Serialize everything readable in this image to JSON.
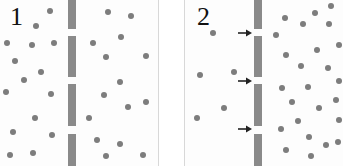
{
  "colors": {
    "background": "#fdfdfd",
    "membrane": "#8a8a8a",
    "particle": "#7d7d7d",
    "arrow": "#222222",
    "separator": "#d8d8d8"
  },
  "panels": [
    {
      "label": "1",
      "description": "membrane with pores, particles on both sides",
      "membrane_x": 68,
      "segments": [
        [
          0,
          29
        ],
        [
          36,
          77
        ],
        [
          84,
          126
        ],
        [
          134,
          166
        ]
      ],
      "particles_left": [
        [
          50,
          11
        ],
        [
          36,
          26
        ],
        [
          7,
          43
        ],
        [
          32,
          45
        ],
        [
          54,
          43
        ],
        [
          15,
          61
        ],
        [
          41,
          72
        ],
        [
          24,
          80
        ],
        [
          6,
          92
        ],
        [
          51,
          94
        ],
        [
          35,
          118
        ],
        [
          13,
          132
        ],
        [
          52,
          135
        ],
        [
          10,
          155
        ],
        [
          33,
          153
        ]
      ],
      "particles_right": [
        [
          108,
          12
        ],
        [
          131,
          16
        ],
        [
          93,
          43
        ],
        [
          121,
          37
        ],
        [
          106,
          57
        ],
        [
          146,
          56
        ],
        [
          120,
          82
        ],
        [
          104,
          95
        ],
        [
          146,
          102
        ],
        [
          128,
          107
        ],
        [
          89,
          118
        ],
        [
          97,
          140
        ],
        [
          120,
          144
        ],
        [
          106,
          156
        ],
        [
          143,
          155
        ]
      ]
    },
    {
      "label": "2",
      "description": "particles moving through pores toward the right side (arrows at pores)",
      "membrane_x": 254,
      "segments": [
        [
          0,
          29
        ],
        [
          36,
          77
        ],
        [
          84,
          126
        ],
        [
          134,
          166
        ]
      ],
      "arrows_y": [
        33,
        81,
        129
      ],
      "particles_left": [
        [
          213,
          33
        ],
        [
          200,
          75
        ],
        [
          234,
          72
        ],
        [
          224,
          108
        ],
        [
          197,
          118
        ]
      ],
      "particles_right": [
        [
          331,
          6
        ],
        [
          315,
          13
        ],
        [
          285,
          18
        ],
        [
          303,
          24
        ],
        [
          329,
          24
        ],
        [
          276,
          35
        ],
        [
          286,
          55
        ],
        [
          317,
          50
        ],
        [
          339,
          45
        ],
        [
          301,
          66
        ],
        [
          328,
          68
        ],
        [
          282,
          88
        ],
        [
          308,
          87
        ],
        [
          339,
          81
        ],
        [
          292,
          102
        ],
        [
          319,
          108
        ],
        [
          336,
          100
        ],
        [
          298,
          121
        ],
        [
          339,
          120
        ],
        [
          281,
          129
        ],
        [
          309,
          137
        ],
        [
          286,
          150
        ],
        [
          326,
          145
        ],
        [
          311,
          156
        ],
        [
          338,
          142
        ]
      ]
    }
  ]
}
